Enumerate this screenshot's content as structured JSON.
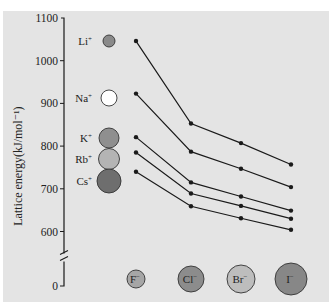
{
  "header_cutoff_text": "",
  "chart_data": {
    "type": "line",
    "title": "",
    "xlabel": "",
    "ylabel": "Lattice energy(kJ/mol⁻¹)",
    "ylim": [
      0,
      1100
    ],
    "axis_break": true,
    "yticks": [
      0,
      600,
      700,
      800,
      900,
      1000,
      1100
    ],
    "grid": false,
    "categories": [
      "F⁻",
      "Cl⁻",
      "Br⁻",
      "I⁻"
    ],
    "series": [
      {
        "name": "Li⁺",
        "values": [
          1046,
          853,
          807,
          757
        ]
      },
      {
        "name": "Na⁺",
        "values": [
          923,
          787,
          747,
          704
        ]
      },
      {
        "name": "K⁺",
        "values": [
          821,
          715,
          682,
          649
        ]
      },
      {
        "name": "Rb⁺",
        "values": [
          785,
          689,
          660,
          630
        ]
      },
      {
        "name": "Cs⁺",
        "values": [
          740,
          659,
          631,
          604
        ]
      }
    ],
    "legend": "ion spheres at left (cations) and bottom (anions)"
  },
  "cations": [
    {
      "label": "Li",
      "charge": "+",
      "color": "#8a8a8a",
      "r": 6
    },
    {
      "label": "Na",
      "charge": "+",
      "color": "#ffffff",
      "r": 8
    },
    {
      "label": "K",
      "charge": "+",
      "color": "#8f8f8f",
      "r": 10
    },
    {
      "label": "Rb",
      "charge": "+",
      "color": "#b4b4b4",
      "r": 10.5
    },
    {
      "label": "Cs",
      "charge": "+",
      "color": "#6e6e6e",
      "r": 12
    }
  ],
  "anions": [
    {
      "label": "F",
      "charge": "−",
      "color": "#a6a6a6",
      "r": 9
    },
    {
      "label": "Cl",
      "charge": "−",
      "color": "#8c8c8c",
      "r": 13
    },
    {
      "label": "Br",
      "charge": "−",
      "color": "#bdbdbd",
      "r": 14
    },
    {
      "label": "I",
      "charge": "−",
      "color": "#878787",
      "r": 16
    }
  ],
  "colors": {
    "panel": "#e4e4e4",
    "line": "#1a1a1a",
    "text": "#222222"
  }
}
